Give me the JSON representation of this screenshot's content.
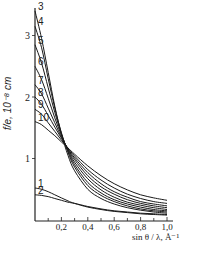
{
  "chart_data": {
    "type": "line",
    "title": "",
    "xlabel": "sin θ / λ, Å⁻¹",
    "ylabel": "f/e, 10⁻⁸ cm",
    "xlim": [
      0.0,
      1.0
    ],
    "ylim": [
      0.0,
      3.5
    ],
    "x_ticks": [
      0.2,
      0.4,
      0.6,
      0.8,
      1.0
    ],
    "x_tick_labels": [
      "0,2",
      "0,4",
      "0,6",
      "0,8",
      "1,0"
    ],
    "y_ticks": [
      1,
      2,
      3
    ],
    "y_tick_labels": [
      "1",
      "2",
      "3"
    ],
    "grid": false,
    "legend": "curve numbers labeled at left end of each curve",
    "x": [
      0.0,
      0.05,
      0.1,
      0.15,
      0.2,
      0.25,
      0.3,
      0.4,
      0.5,
      0.6,
      0.7,
      0.8,
      0.9,
      1.0
    ],
    "series": [
      {
        "name": "1",
        "values": [
          0.52,
          0.5,
          0.46,
          0.41,
          0.36,
          0.31,
          0.27,
          0.21,
          0.17,
          0.14,
          0.12,
          0.1,
          0.09,
          0.08
        ]
      },
      {
        "name": "2",
        "values": [
          0.41,
          0.4,
          0.38,
          0.35,
          0.32,
          0.29,
          0.27,
          0.22,
          0.18,
          0.15,
          0.13,
          0.11,
          0.1,
          0.09
        ]
      },
      {
        "name": "3",
        "values": [
          3.4,
          2.95,
          2.4,
          1.85,
          1.4,
          1.05,
          0.8,
          0.5,
          0.35,
          0.26,
          0.2,
          0.16,
          0.13,
          0.11
        ]
      },
      {
        "name": "4",
        "values": [
          3.15,
          2.8,
          2.3,
          1.82,
          1.42,
          1.1,
          0.86,
          0.56,
          0.4,
          0.3,
          0.23,
          0.18,
          0.15,
          0.13
        ]
      },
      {
        "name": "5",
        "values": [
          2.85,
          2.55,
          2.15,
          1.75,
          1.4,
          1.12,
          0.9,
          0.61,
          0.44,
          0.33,
          0.26,
          0.21,
          0.17,
          0.15
        ]
      },
      {
        "name": "6",
        "values": [
          2.5,
          2.28,
          1.98,
          1.66,
          1.38,
          1.14,
          0.94,
          0.67,
          0.49,
          0.37,
          0.29,
          0.24,
          0.2,
          0.17
        ]
      },
      {
        "name": "7",
        "values": [
          2.2,
          2.05,
          1.82,
          1.58,
          1.35,
          1.15,
          0.98,
          0.72,
          0.54,
          0.42,
          0.33,
          0.27,
          0.23,
          0.2
        ]
      },
      {
        "name": "8",
        "values": [
          2.0,
          1.88,
          1.7,
          1.51,
          1.33,
          1.16,
          1.01,
          0.77,
          0.59,
          0.46,
          0.37,
          0.3,
          0.26,
          0.23
        ]
      },
      {
        "name": "9",
        "values": [
          1.8,
          1.72,
          1.58,
          1.44,
          1.3,
          1.17,
          1.04,
          0.82,
          0.65,
          0.52,
          0.42,
          0.35,
          0.3,
          0.27
        ]
      },
      {
        "name": "10",
        "values": [
          1.6,
          1.55,
          1.46,
          1.37,
          1.27,
          1.17,
          1.07,
          0.88,
          0.72,
          0.59,
          0.49,
          0.41,
          0.36,
          0.32
        ]
      }
    ]
  },
  "labels": {
    "ylabel": "f/e, 10⁻⁸ cm",
    "xlabel": "sin θ / λ, Å⁻¹"
  }
}
